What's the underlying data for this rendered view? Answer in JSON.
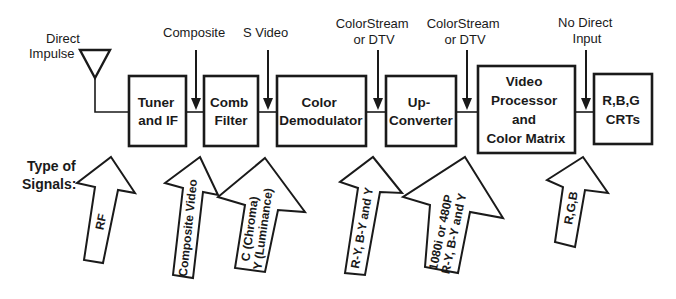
{
  "diagram": {
    "inputs": {
      "antenna": [
        "Direct",
        "Impulse"
      ],
      "composite": [
        "Composite"
      ],
      "svideo": [
        "S Video"
      ],
      "colorstream1": [
        "ColorStream",
        "or DTV"
      ],
      "colorstream2": [
        "ColorStream",
        "or DTV"
      ],
      "nodirect": [
        "No Direct",
        "Input"
      ]
    },
    "blocks": [
      {
        "id": "tuner",
        "lines": [
          "Tuner",
          "and IF"
        ]
      },
      {
        "id": "comb",
        "lines": [
          "Comb",
          "Filter"
        ]
      },
      {
        "id": "demod",
        "lines": [
          "Color",
          "Demodulator"
        ]
      },
      {
        "id": "upconv",
        "lines": [
          "Up-",
          "Converter"
        ]
      },
      {
        "id": "vproc",
        "lines": [
          "Video",
          "Processor",
          "and",
          "Color Matrix"
        ]
      },
      {
        "id": "crt",
        "lines": [
          "R,B,G",
          "CRTs"
        ]
      }
    ],
    "signals_label": [
      "Type of",
      "Signals:"
    ],
    "signals": [
      {
        "id": "rf",
        "lines": [
          "RF"
        ]
      },
      {
        "id": "composite-video",
        "lines": [
          "Composite Video"
        ]
      },
      {
        "id": "chroma-luma",
        "lines": [
          "C (Chroma)",
          "Y (Luminance)"
        ]
      },
      {
        "id": "ry-by-y",
        "lines": [
          "R-Y, B-Y and Y"
        ]
      },
      {
        "id": "hd",
        "lines": [
          "1080i or 480P",
          "R-Y, B-Y and Y"
        ]
      },
      {
        "id": "rgb",
        "lines": [
          "R,G,B"
        ]
      }
    ],
    "colors": {
      "ink": "#1a1a1a",
      "background": "#ffffff"
    }
  }
}
